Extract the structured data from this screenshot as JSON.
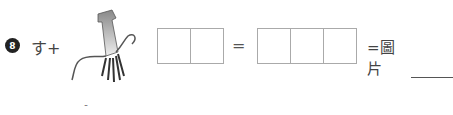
{
  "question": {
    "number": "8",
    "prefix_text": "す+",
    "image": "squid-illustration",
    "equals_1": "=",
    "result_prefix": "=圖片",
    "answer_blank": "",
    "box_group_1_cells": 2,
    "box_group_2_cells": 3,
    "footer_mark": "¨"
  }
}
